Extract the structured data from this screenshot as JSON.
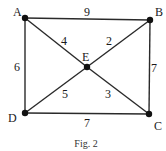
{
  "figure": {
    "caption": "Fig. 2",
    "nodes": [
      {
        "id": "A",
        "label": "A",
        "x": 25,
        "y": 18,
        "lx": 13,
        "ly": 16
      },
      {
        "id": "B",
        "label": "B",
        "x": 150,
        "y": 20,
        "lx": 155,
        "ly": 16
      },
      {
        "id": "C",
        "label": "C",
        "x": 149,
        "y": 114,
        "lx": 154,
        "ly": 130
      },
      {
        "id": "D",
        "label": "D",
        "x": 25,
        "y": 113,
        "lx": 8,
        "ly": 122
      },
      {
        "id": "E",
        "label": "E",
        "x": 87,
        "y": 67,
        "lx": 82,
        "ly": 61
      }
    ],
    "edges": [
      {
        "from": "A",
        "to": "B",
        "weight": "9",
        "wx": 84,
        "wy": 16
      },
      {
        "from": "A",
        "to": "E",
        "weight": "4",
        "wx": 61,
        "wy": 45
      },
      {
        "from": "B",
        "to": "E",
        "weight": "2",
        "wx": 106,
        "wy": 45
      },
      {
        "from": "A",
        "to": "D",
        "weight": "6",
        "wx": 14,
        "wy": 71
      },
      {
        "from": "B",
        "to": "C",
        "weight": "7",
        "wx": 151,
        "wy": 72
      },
      {
        "from": "D",
        "to": "E",
        "weight": "5",
        "wx": 62,
        "wy": 98
      },
      {
        "from": "E",
        "to": "C",
        "weight": "3",
        "wx": 105,
        "wy": 98
      },
      {
        "from": "D",
        "to": "C",
        "weight": "7",
        "wx": 84,
        "wy": 127
      }
    ]
  }
}
